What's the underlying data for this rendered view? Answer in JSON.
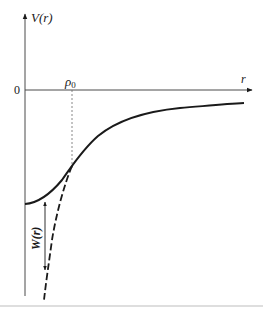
{
  "diagram": {
    "type": "potential-energy-curve",
    "y_axis": {
      "label": "V(r)"
    },
    "x_axis": {
      "label": "r"
    },
    "origin_label": "0",
    "marker": {
      "label": "ρ",
      "subscript": "0",
      "style": "dashed-vertical"
    },
    "curves": [
      {
        "name": "V(r)",
        "style": "solid"
      },
      {
        "name": "extrapolated",
        "style": "dashed"
      }
    ],
    "annotation": {
      "label": "W(r)",
      "style": "double-arrow-vertical"
    }
  },
  "colors": {
    "ink": "#1a1a1a",
    "axis": "#4a4a4a",
    "rule": "#bdbdbd"
  }
}
